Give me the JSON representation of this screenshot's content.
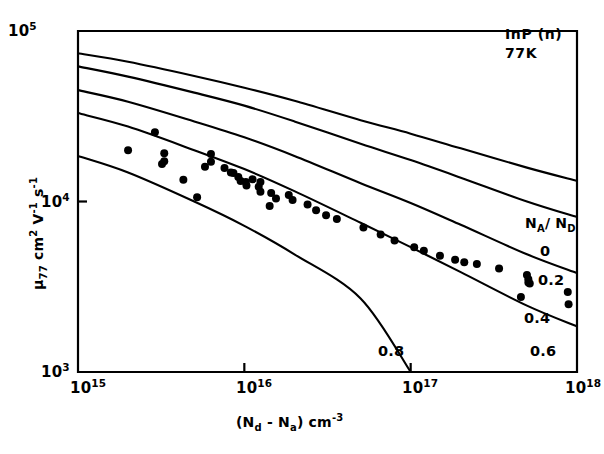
{
  "annotation": {
    "material": "InP (n)",
    "temperature": "77K"
  },
  "legend": {
    "title_main": "N",
    "title_sub1": "A",
    "title_slash": "/ N",
    "title_sub2": "D",
    "title_plain": "N_A / N_D",
    "entries": [
      {
        "label": "0",
        "value": 0.0
      },
      {
        "label": "0.2",
        "value": 0.2
      },
      {
        "label": "0.4",
        "value": 0.4
      },
      {
        "label": "0.6",
        "value": 0.6
      },
      {
        "label": "0.8",
        "value": 0.8
      }
    ]
  },
  "axes": {
    "x": {
      "label_pre": "(N",
      "label_sub1": "d",
      "label_mid": " - N",
      "label_sub2": "a",
      "label_post": ") cm",
      "label_sup": "-3",
      "label_plain": "(Nd - Na) cm-3",
      "ticks": [
        {
          "mantissa": "10",
          "exponent": "15",
          "value": 1000000000000000.0
        },
        {
          "mantissa": "10",
          "exponent": "16",
          "value": 1e+16
        },
        {
          "mantissa": "10",
          "exponent": "17",
          "value": 1e+17
        },
        {
          "mantissa": "10",
          "exponent": "18",
          "value": 1e+18
        }
      ]
    },
    "y": {
      "label_mu": "μ",
      "label_sub": "77",
      "label_rest": " cm",
      "label_sup1": "2",
      "label_v": " V",
      "label_sup2": "-1",
      "label_s": " s",
      "label_sup3": "-1",
      "label_plain": "μ77 cm2 V-1 s-1",
      "ticks": [
        {
          "mantissa": "10",
          "exponent": "5",
          "value": 100000.0
        },
        {
          "mantissa": "10",
          "exponent": "4",
          "value": 10000.0
        },
        {
          "mantissa": "10",
          "exponent": "3",
          "value": 1000.0
        }
      ]
    }
  },
  "chart_data": {
    "type": "line",
    "title": "",
    "xlabel": "(Nd - Na) cm-3",
    "ylabel": "mu_77 cm2 V-1 s-1",
    "xscale": "log",
    "yscale": "log",
    "xlim": [
      1000000000000000.0,
      1e+18
    ],
    "ylim": [
      1000.0,
      100000.0
    ],
    "grid": false,
    "legend_position": "right-inside",
    "annotations": [
      "InP (n)",
      "77K"
    ],
    "series": [
      {
        "name": "0",
        "compensation_ratio": 0.0,
        "x": [
          1000000000000000.0,
          2000000000000000.0,
          5000000000000000.0,
          1e+16,
          2e+16,
          5e+16,
          1e+17,
          2e+17,
          5e+17,
          1e+18
        ],
        "y": [
          74000,
          66000,
          54500,
          46500,
          39000,
          30000,
          25000,
          20500,
          15800,
          13200
        ]
      },
      {
        "name": "0.2",
        "compensation_ratio": 0.2,
        "x": [
          1000000000000000.0,
          2000000000000000.0,
          5000000000000000.0,
          1e+16,
          2e+16,
          5e+16,
          1e+17,
          2e+17,
          5e+17,
          1e+18
        ],
        "y": [
          62000,
          54000,
          43500,
          36500,
          29500,
          21800,
          17500,
          13800,
          10000,
          8100
        ]
      },
      {
        "name": "0.4",
        "compensation_ratio": 0.4,
        "x": [
          1000000000000000.0,
          2000000000000000.0,
          5000000000000000.0,
          1e+16,
          2e+16,
          5e+16,
          1e+17,
          2e+17,
          5e+17,
          1e+18
        ],
        "y": [
          45000,
          38500,
          29500,
          23800,
          18500,
          12800,
          9800,
          7300,
          4900,
          3800
        ]
      },
      {
        "name": "0.6",
        "compensation_ratio": 0.6,
        "x": [
          1000000000000000.0,
          2000000000000000.0,
          5000000000000000.0,
          1e+16,
          2e+16,
          5e+16,
          1e+17,
          2e+17,
          5e+17,
          1e+18
        ],
        "y": [
          33000,
          27500,
          20000,
          15500,
          11500,
          7500,
          5400,
          3850,
          2450,
          1850
        ]
      },
      {
        "name": "0.8",
        "compensation_ratio": 0.8,
        "x": [
          1000000000000000.0,
          2000000000000000.0,
          5000000000000000.0,
          1e+16,
          2e+16,
          5e+16,
          1e+17
        ],
        "y": [
          18500,
          14800,
          10000,
          7200,
          4900,
          2700,
          1000
        ]
      }
    ],
    "scatter": {
      "name": "measured mobility",
      "marker": "filled-circle",
      "points": [
        [
          2900000000000000.0,
          25500
        ],
        [
          2000000000000000.0,
          20000
        ],
        [
          3300000000000000.0,
          19200
        ],
        [
          3300000000000000.0,
          17200
        ],
        [
          3200000000000000.0,
          16600
        ],
        [
          4300000000000000.0,
          13400
        ],
        [
          6300000000000000.0,
          19000
        ],
        [
          6300000000000000.0,
          17100
        ],
        [
          5800000000000000.0,
          16000
        ],
        [
          5200000000000000.0,
          10600
        ],
        [
          7600000000000000.0,
          15700
        ],
        [
          8300000000000000.0,
          14800
        ],
        [
          8600000000000000.0,
          14700
        ],
        [
          9200000000000000.0,
          13900
        ],
        [
          9500000000000000.0,
          13200
        ],
        [
          1.02e+16,
          13000
        ],
        [
          1.03e+16,
          12400
        ],
        [
          1.12e+16,
          13500
        ],
        [
          1.25e+16,
          13000
        ],
        [
          1.22e+16,
          12200
        ],
        [
          1.25e+16,
          11400
        ],
        [
          1.45e+16,
          11200
        ],
        [
          1.55e+16,
          10400
        ],
        [
          1.42e+16,
          9400
        ],
        [
          1.85e+16,
          10900
        ],
        [
          1.95e+16,
          10200
        ],
        [
          2.4e+16,
          9600
        ],
        [
          2.7e+16,
          8900
        ],
        [
          3.1e+16,
          8300
        ],
        [
          3.6e+16,
          7900
        ],
        [
          5.2e+16,
          7050
        ],
        [
          6.6e+16,
          6400
        ],
        [
          8e+16,
          5900
        ],
        [
          1.05e+17,
          5400
        ],
        [
          1.2e+17,
          5150
        ],
        [
          1.5e+17,
          4800
        ],
        [
          1.85e+17,
          4550
        ],
        [
          2.1e+17,
          4400
        ],
        [
          2.5e+17,
          4300
        ],
        [
          3.4e+17,
          4050
        ],
        [
          5e+17,
          3700
        ],
        [
          5.1e+17,
          3500
        ],
        [
          5.1e+17,
          3350
        ],
        [
          5.2e+17,
          3300
        ],
        [
          4.6e+17,
          2750
        ],
        [
          8.8e+17,
          2950
        ],
        [
          8.9e+17,
          2500
        ]
      ]
    }
  }
}
